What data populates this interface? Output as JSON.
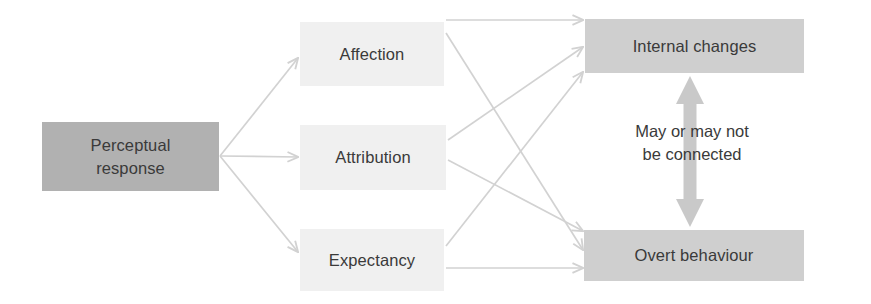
{
  "diagram": {
    "colors": {
      "background": "#ffffff",
      "node_dark": "#b1b1b1",
      "node_faint": "#f0f0f0",
      "node_mid": "#cfcfcf",
      "edge": "#d2d2d2",
      "thick_arrow": "#c9c9c9",
      "text": "#3a3a3a"
    },
    "nodes": {
      "source": {
        "label_line1": "Perceptual",
        "label_line2": "response",
        "shade": "dark"
      },
      "mediators": [
        {
          "label": "Affection",
          "shade": "faint"
        },
        {
          "label": "Attribution",
          "shade": "faint"
        },
        {
          "label": "Expectancy",
          "shade": "faint"
        }
      ],
      "outcomes": [
        {
          "label": "Internal changes",
          "shade": "mid"
        },
        {
          "label": "Overt behaviour",
          "shade": "mid"
        }
      ]
    },
    "annotation": {
      "line1": "May or may not",
      "line2": "be connected"
    },
    "edges": [
      {
        "from": "Perceptual response",
        "to": "Affection",
        "style": "thin-arrow"
      },
      {
        "from": "Perceptual response",
        "to": "Attribution",
        "style": "thin-arrow"
      },
      {
        "from": "Perceptual response",
        "to": "Expectancy",
        "style": "thin-arrow"
      },
      {
        "from": "Affection",
        "to": "Internal changes",
        "style": "thin-arrow"
      },
      {
        "from": "Affection",
        "to": "Overt behaviour",
        "style": "thin-arrow"
      },
      {
        "from": "Attribution",
        "to": "Internal changes",
        "style": "thin-arrow"
      },
      {
        "from": "Attribution",
        "to": "Overt behaviour",
        "style": "thin-arrow"
      },
      {
        "from": "Expectancy",
        "to": "Internal changes",
        "style": "thin-arrow"
      },
      {
        "from": "Expectancy",
        "to": "Overt behaviour",
        "style": "thin-arrow"
      },
      {
        "from": "Internal changes",
        "to": "Overt behaviour",
        "style": "thick-double-arrow",
        "label": "May or may not be connected"
      }
    ]
  }
}
